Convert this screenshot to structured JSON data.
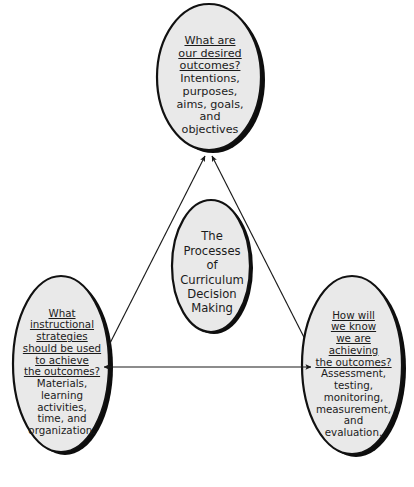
{
  "diagram": {
    "title": "The Processes of Curriculum Decision Making",
    "type": "triangular-cycle-diagram",
    "colors": {
      "node_fill": "#e9e9e9",
      "node_stroke": "#111111",
      "shadow": "#0d0d0d",
      "arrow": "#1a1a1a",
      "background": "#ffffff",
      "text": "#1b1b1b"
    },
    "nodes": {
      "top": {
        "id": "desired-outcomes",
        "question": "What are\nour desired\noutcomes?",
        "answer": "Intentions,\npurposes,\naims, goals,\nand\nobjectives"
      },
      "center": {
        "id": "curriculum-decision-making",
        "label": "The\nProcesses\nof\nCurriculum\nDecision\nMaking"
      },
      "left": {
        "id": "instructional-strategies",
        "question": "What\ninstructional\nstrategies\nshould be used\nto achieve\nthe outcomes?",
        "answer": "Materials,\nlearning\nactivities,\ntime, and\norganization."
      },
      "right": {
        "id": "achievement-evaluation",
        "question": "How will\nwe know\nwe are\nachieving\nthe outcomes?",
        "answer": "Assessment,\ntesting,\nmonitoring,\nmeasurement,\nand\nevaluation."
      }
    },
    "connectors": [
      {
        "id": "left-to-top",
        "from": "instructional-strategies",
        "to": "desired-outcomes",
        "style": "double-headed"
      },
      {
        "id": "right-to-top",
        "from": "achievement-evaluation",
        "to": "desired-outcomes",
        "style": "double-headed"
      },
      {
        "id": "left-to-right",
        "from": "instructional-strategies",
        "to": "achievement-evaluation",
        "style": "double-headed"
      }
    ]
  }
}
